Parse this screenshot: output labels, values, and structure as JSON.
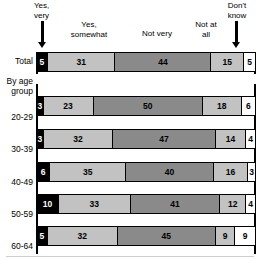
{
  "callouts": {
    "yes_very": "Yes,\nvery",
    "yes_somewhat": "Yes,\nsomewhat",
    "not_very": "Not very",
    "not_at_all": "Not at\nall",
    "dont_know": "Don't\nknow"
  },
  "row_labels": {
    "total": "Total",
    "by_age_group": "By age\ngroup",
    "a20_29": "20-29",
    "a30_39": "30-39",
    "a40_49": "40-49",
    "a50_59": "50-59",
    "a60_64": "60-64"
  },
  "colors": {
    "yes_very": "#000000",
    "yes_somewhat": "#c2c2c2",
    "not_very": "#8a8a8a",
    "not_at_all": "#c2c2c2",
    "dont_know": "#ffffff",
    "outline": "#000000",
    "background": "#ffffff"
  },
  "values": {
    "total": {
      "yes_very": "5",
      "yes_somewhat": "31",
      "not_very": "44",
      "not_at_all": "15",
      "dont_know": "5"
    },
    "a20_29": {
      "yes_very": "3",
      "yes_somewhat": "23",
      "not_very": "50",
      "not_at_all": "18",
      "dont_know": "6"
    },
    "a30_39": {
      "yes_very": "3",
      "yes_somewhat": "32",
      "not_very": "47",
      "not_at_all": "14",
      "dont_know": "4"
    },
    "a40_49": {
      "yes_very": "6",
      "yes_somewhat": "35",
      "not_very": "40",
      "not_at_all": "16",
      "dont_know": "3"
    },
    "a50_59": {
      "yes_very": "10",
      "yes_somewhat": "33",
      "not_very": "41",
      "not_at_all": "12",
      "dont_know": "4"
    },
    "a60_64": {
      "yes_very": "5",
      "yes_somewhat": "32",
      "not_very": "45",
      "not_at_all": "9",
      "dont_know": "9"
    }
  },
  "chart_data": {
    "type": "bar",
    "orientation": "horizontal",
    "stacked": true,
    "stack_total": 100,
    "title": "",
    "xlabel": "",
    "ylabel": "",
    "xlim": [
      0,
      100
    ],
    "grid": false,
    "legend_position": "top-callouts",
    "categories": [
      "Total",
      "20-29",
      "30-39",
      "40-49",
      "50-59",
      "60-64"
    ],
    "category_group_label": "By age group",
    "series": [
      {
        "name": "Yes, very",
        "color": "#000000",
        "values": [
          5,
          3,
          3,
          6,
          10,
          5
        ]
      },
      {
        "name": "Yes, somewhat",
        "color": "#c2c2c2",
        "values": [
          31,
          23,
          32,
          35,
          33,
          32
        ]
      },
      {
        "name": "Not very",
        "color": "#8a8a8a",
        "values": [
          44,
          50,
          47,
          40,
          41,
          45
        ]
      },
      {
        "name": "Not at all",
        "color": "#c2c2c2",
        "values": [
          15,
          18,
          14,
          16,
          12,
          9
        ]
      },
      {
        "name": "Don't know",
        "color": "#ffffff",
        "values": [
          5,
          6,
          4,
          3,
          4,
          9
        ]
      }
    ],
    "annotations": [
      {
        "text": "Yes, very",
        "points_to": "Yes, very segment",
        "arrow": "down"
      },
      {
        "text": "Don't know",
        "points_to": "Don't know segment",
        "arrow": "down"
      }
    ]
  }
}
